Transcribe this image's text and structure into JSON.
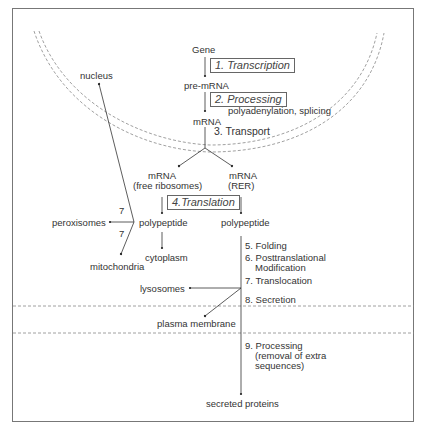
{
  "diagram": {
    "type": "protein-biosynthesis-flow",
    "nodes": {
      "gene": "Gene",
      "pre_mrna": "pre-mRNA",
      "mrna": "mRNA",
      "mrna_free": "mRNA",
      "mrna_free_sub": "(free ribosomes)",
      "mrna_rer": "mRNA",
      "mrna_rer_sub": "(RER)",
      "polypeptide_free": "polypeptide",
      "polypeptide_rer": "polypeptide",
      "nucleus": "nucleus",
      "peroxisomes": "peroxisomes",
      "mitochondria": "mitochondria",
      "cytoplasm": "cytoplasm",
      "lysosomes": "lysosomes",
      "plasma_membrane": "plasma membrane",
      "secreted_proteins": "secreted proteins"
    },
    "steps": {
      "transcription": "1. Transcription",
      "processing": "2.  Processing",
      "processing_note": "polyadenylation, splicing",
      "transport": "3. Transport",
      "translation": "4.Translation",
      "folding": "5. Folding",
      "posttranslational_1": "6. Posttranslational",
      "posttranslational_2": "Modification",
      "translocation": "7. Translocation",
      "secretion": "8. Secretion",
      "processing9_1": "9. Processing",
      "processing9_2": "(removal of extra",
      "processing9_3": "sequences)",
      "label7_upper": "7",
      "label7_lower": "7"
    },
    "edges": [
      [
        "Gene",
        "pre-mRNA"
      ],
      [
        "pre-mRNA",
        "mRNA"
      ],
      [
        "mRNA",
        "mRNA (free ribosomes)"
      ],
      [
        "mRNA",
        "mRNA (RER)"
      ],
      [
        "mRNA (free ribosomes)",
        "polypeptide (free)"
      ],
      [
        "mRNA (RER)",
        "polypeptide (RER)"
      ],
      [
        "polypeptide (free)",
        "nucleus"
      ],
      [
        "polypeptide (free)",
        "peroxisomes"
      ],
      [
        "polypeptide (free)",
        "mitochondria"
      ],
      [
        "polypeptide (free)",
        "cytoplasm"
      ],
      [
        "polypeptide (RER)",
        "lysosomes"
      ],
      [
        "polypeptide (RER)",
        "plasma membrane"
      ],
      [
        "polypeptide (RER)",
        "secreted proteins"
      ]
    ]
  }
}
